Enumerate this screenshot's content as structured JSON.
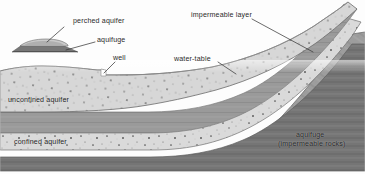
{
  "figure": {
    "type": "geological-cross-section",
    "width": 365,
    "height": 174
  },
  "labels": {
    "perched_aquifer": "perched aquifer",
    "aquifuge": "aquifuge",
    "well": "well",
    "water_table": "water-table",
    "impermeable_layer": "impermeable layer",
    "unconfined_aquifer": "unconfined aquifer",
    "confined_aquifer": "confined aquifer",
    "aquifuge_rocks_line1": "aquifuge",
    "aquifuge_rocks_line2": "(impermeable rocks)"
  },
  "colors": {
    "background": "#fdfdfd",
    "sand_aquifer": "#d9d9d9",
    "sand_aquifer_dark": "#cfcfcf",
    "impermeable_band": "#9a9a9a",
    "impermeable_band_dark": "#8a8a8a",
    "aquifuge_mass": "#9d9d9d",
    "basement": "#6f6f6f",
    "outline": "#5a5a5a",
    "leader_line": "#333333",
    "text": "#2b2b2b",
    "speckle": "#3a3a3a"
  },
  "layers": [
    {
      "name": "unconfined-aquifer",
      "description": "upper speckled sand body beneath the water table"
    },
    {
      "name": "impermeable-layer",
      "description": "grey dipping band separating the two aquifers"
    },
    {
      "name": "confined-aquifer",
      "description": "lower speckled sand body between impermeable beds"
    },
    {
      "name": "basement",
      "description": "dark basal impermeable bed"
    },
    {
      "name": "aquifuge-mass",
      "description": "grey impermeable rock mass on the right flank"
    },
    {
      "name": "perched-aquifer-inset",
      "description": "small detached lens at upper left with its own aquifuge"
    }
  ]
}
